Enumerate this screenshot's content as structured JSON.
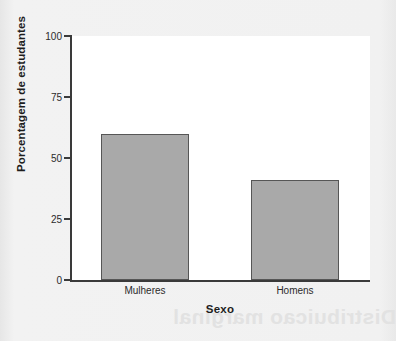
{
  "chart_data": {
    "type": "bar",
    "title": "",
    "subtitle": "",
    "xlabel": "Sexo",
    "ylabel": "Porcentagem de estudantes",
    "categories": [
      "Mulheres",
      "Homens"
    ],
    "values": [
      60,
      41
    ],
    "ylim": [
      0,
      100
    ],
    "yticks": [
      0,
      25,
      50,
      75,
      100
    ],
    "ytick_labels": [
      "0",
      "25",
      "50",
      "75",
      "100"
    ],
    "grid": false,
    "legend": false,
    "legend_position": "none",
    "bar_fill_color": "#a9a9a9",
    "bar_edge_color": "#565656",
    "axis_color": "#3a3a3a",
    "plot_background": "#ffffff",
    "figure_background": "#efefef"
  },
  "annotations": {
    "bleed_through_text": "Distribuicao marginal"
  }
}
